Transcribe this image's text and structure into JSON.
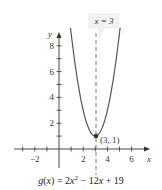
{
  "chart_data": {
    "type": "line",
    "title": "",
    "function": "g(x) = 2x^2 - 12x + 19",
    "caption": "g(x) = 2x² − 12x + 19",
    "xlabel": "x",
    "ylabel": "y",
    "xlim": [
      -3.5,
      7
    ],
    "ylim": [
      0,
      9
    ],
    "x_ticks": [
      -3,
      -2,
      -1,
      1,
      2,
      3,
      4,
      5,
      6
    ],
    "x_tick_labels": [
      "-2",
      "2",
      "4",
      "6"
    ],
    "y_ticks": [
      1,
      2,
      3,
      4,
      5,
      6,
      7,
      8
    ],
    "y_tick_labels": [
      "2",
      "4",
      "6",
      "8"
    ],
    "series": [
      {
        "name": "g(x)",
        "x": [
          1,
          1.5,
          2,
          2.5,
          3,
          3.5,
          4,
          4.5,
          5
        ],
        "values": [
          9,
          5.5,
          3,
          1.5,
          1,
          1.5,
          3,
          5.5,
          9
        ]
      }
    ],
    "annotations": [
      {
        "type": "point",
        "x": 3,
        "y": 1,
        "label": "(3, 1)"
      },
      {
        "type": "vline",
        "x": 3,
        "style": "dashed",
        "label": "x = 3"
      }
    ],
    "grid": false
  }
}
